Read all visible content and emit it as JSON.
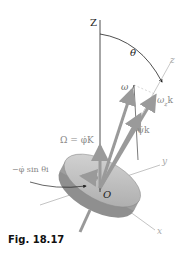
{
  "figure": {
    "caption": "Fig. 18.17",
    "labels": {
      "Z_axis": "Z",
      "theta": "θ",
      "z_axis": "z",
      "omega": "ω",
      "omega_z_k": "ω",
      "omega_z_sub": "z",
      "omega_z_k_suffix": "k",
      "Omega_eq": "Ω = φ̇K",
      "psi_dot_k": "ψ̇k",
      "minus_phi_sin": "−φ̇ sin θi",
      "origin": "O",
      "y_axis": "y",
      "x_axis": "x"
    },
    "colors": {
      "axis_line": "#222222",
      "vector_gray": "#9a9a9a",
      "label_gray": "#8a8a8a",
      "disk_fill": "#c9c9c9",
      "disk_shadow": "#8f8f8f"
    }
  }
}
